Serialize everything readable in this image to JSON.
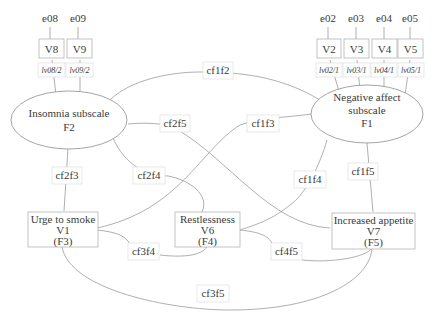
{
  "errors": {
    "e08": "e08",
    "e09": "e09",
    "e02": "e02",
    "e03": "e03",
    "e04": "e04",
    "e05": "e05"
  },
  "indicators": {
    "V8": "V8",
    "V9": "V9",
    "V2": "V2",
    "V3": "V3",
    "V4": "V4",
    "V5": "V5"
  },
  "loadings": {
    "lv08f2": "lv08/2",
    "lv09f2": "lv09/2",
    "lv02f1": "lv02/1",
    "lv03f1": "lv03/1",
    "lv04f1": "lv04/1",
    "lv05f1": "lv05/1"
  },
  "factors": {
    "F2": {
      "line1": "Insomnia subscale",
      "line2": "F2"
    },
    "F1": {
      "line1": "Negative affect",
      "line2": "subscale",
      "line3": "F1"
    }
  },
  "observed": {
    "V1": {
      "line1": "Urge to smoke",
      "line2": "V1",
      "line3": "(F3)"
    },
    "V6": {
      "line1": "Restlessness",
      "line2": "V6",
      "line3": "(F4)"
    },
    "V7": {
      "line1": "Increased appetite",
      "line2": "V7",
      "line3": "(F5)"
    }
  },
  "covariances": {
    "cf1f2": "cf1f2",
    "cf2f5": "cf2f5",
    "cf1f3": "cf1f3",
    "cf2f3": "cf2f3",
    "cf2f4": "cf2f4",
    "cf1f4": "cf1f4",
    "cf1f5": "cf1f5",
    "cf3f4": "cf3f4",
    "cf4f5": "cf4f5",
    "cf3f5": "cf3f5"
  },
  "colors": {
    "line": "#9a9a9a",
    "box_border": "#b5b5b5",
    "text": "#3a3a3a"
  }
}
